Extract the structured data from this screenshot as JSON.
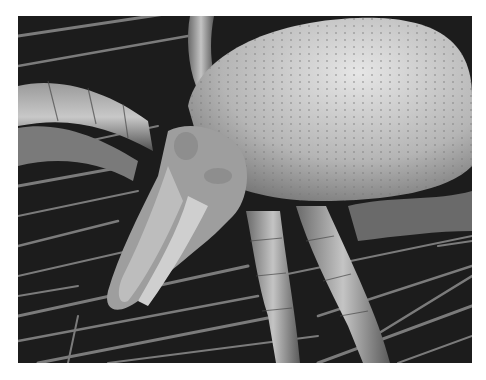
{
  "image": {
    "subject": "scanning electron micrograph of a mite on fibers",
    "colors": {
      "background": "#ffffff",
      "dark": "#1a1a1a",
      "body": "#b8b8b8",
      "highlight": "#e0e0e0",
      "fiber": "#8a8a8a"
    }
  }
}
